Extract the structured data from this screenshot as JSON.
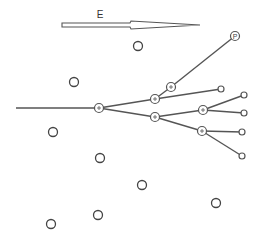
{
  "arrow": {
    "label": "E",
    "direction": "east"
  },
  "origin_line": {
    "x1": 16,
    "y1": 108,
    "x2": 98,
    "y2": 108
  },
  "branch_nodes": [
    {
      "id": "n1",
      "x": 99,
      "y": 108,
      "r": 4.5,
      "marker": "+"
    },
    {
      "id": "n2",
      "x": 155,
      "y": 99,
      "r": 4.5,
      "marker": "+"
    },
    {
      "id": "n3",
      "x": 171,
      "y": 87,
      "r": 4.5,
      "marker": "+"
    },
    {
      "id": "n4",
      "x": 155,
      "y": 117,
      "r": 4.5,
      "marker": "+"
    },
    {
      "id": "n5",
      "x": 203,
      "y": 110,
      "r": 4.5,
      "marker": "+"
    },
    {
      "id": "n6",
      "x": 202,
      "y": 131,
      "r": 4.5,
      "marker": "+"
    }
  ],
  "terminal_nodes": [
    {
      "id": "p",
      "x": 235,
      "y": 36,
      "r": 4.5,
      "label": "P"
    },
    {
      "id": "t1",
      "x": 221,
      "y": 89,
      "r": 3
    },
    {
      "id": "t2",
      "x": 244,
      "y": 95,
      "r": 3
    },
    {
      "id": "t3",
      "x": 244,
      "y": 113,
      "r": 3
    },
    {
      "id": "t4",
      "x": 242,
      "y": 132,
      "r": 3
    },
    {
      "id": "t5",
      "x": 242,
      "y": 156,
      "r": 3
    }
  ],
  "edges": [
    [
      "n1",
      "n2"
    ],
    [
      "n2",
      "n3"
    ],
    [
      "n3",
      "p"
    ],
    [
      "n2",
      "t1"
    ],
    [
      "n1",
      "n4"
    ],
    [
      "n4",
      "n5"
    ],
    [
      "n5",
      "t2"
    ],
    [
      "n5",
      "t3"
    ],
    [
      "n4",
      "n6"
    ],
    [
      "n6",
      "t4"
    ],
    [
      "n6",
      "t5"
    ]
  ],
  "free_circles": [
    {
      "x": 138,
      "y": 46,
      "r": 4.5
    },
    {
      "x": 74,
      "y": 82,
      "r": 4.5
    },
    {
      "x": 53,
      "y": 132,
      "r": 4.5
    },
    {
      "x": 100,
      "y": 158,
      "r": 4.5
    },
    {
      "x": 142,
      "y": 185,
      "r": 4.5
    },
    {
      "x": 216,
      "y": 203,
      "r": 4.5
    },
    {
      "x": 98,
      "y": 215,
      "r": 4.5
    },
    {
      "x": 51,
      "y": 224,
      "r": 4.5
    }
  ]
}
